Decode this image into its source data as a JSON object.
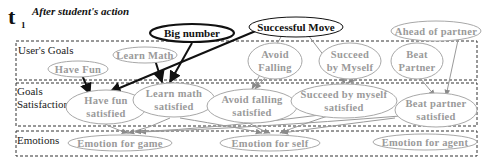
{
  "header": {
    "time_symbol": "t",
    "time_subscript": "1",
    "caption": "After student's action"
  },
  "sections": [
    {
      "id": "users-goals",
      "label_lines": [
        "User's Goals"
      ]
    },
    {
      "id": "goals-satisfaction",
      "label_lines": [
        "Goals",
        "Satisfaction"
      ]
    },
    {
      "id": "emotions",
      "label_lines": [
        "Emotions"
      ]
    }
  ],
  "events": [
    {
      "id": "big-number",
      "label": "Big number",
      "style": "bold"
    },
    {
      "id": "successful-move",
      "label": "Successful Move",
      "style": "bold"
    },
    {
      "id": "ahead-of-partner",
      "label": "Ahead of partner",
      "style": "faded"
    }
  ],
  "user_goals": [
    {
      "id": "have-fun",
      "lines": [
        "Have Fun"
      ]
    },
    {
      "id": "learn-math",
      "lines": [
        "Learn Math"
      ]
    },
    {
      "id": "avoid-falling",
      "lines": [
        "Avoid",
        "Falling"
      ]
    },
    {
      "id": "succeed-by-myself",
      "lines": [
        "Succeed",
        "by Myself"
      ]
    },
    {
      "id": "beat-partner",
      "lines": [
        "Beat",
        "Partner"
      ]
    }
  ],
  "goals_satisfaction": [
    {
      "id": "have-fun-satisfied",
      "lines": [
        "Have fun",
        "satisfied"
      ]
    },
    {
      "id": "learn-math-satisfied",
      "lines": [
        "Learn math",
        "satisfied"
      ]
    },
    {
      "id": "avoid-falling-satisfied",
      "lines": [
        "Avoid falling",
        "satisfied"
      ]
    },
    {
      "id": "succeed-by-myself-satisfied",
      "lines": [
        "Succeed by myself",
        "satisfied"
      ]
    },
    {
      "id": "beat-partner-satisfied",
      "lines": [
        "Beat partner",
        "satisfied"
      ]
    }
  ],
  "emotions": [
    {
      "id": "emotion-for-game",
      "label": "Emotion for game"
    },
    {
      "id": "emotion-for-self",
      "label": "Emotion for  self"
    },
    {
      "id": "emotion-for-agent",
      "label": "Emotion for agent"
    }
  ],
  "edges": [
    {
      "from": "big-number",
      "to": "learn-math-satisfied",
      "style": "dark"
    },
    {
      "from": "big-number",
      "to": "have-fun-satisfied",
      "style": "dark"
    },
    {
      "from": "successful-move",
      "to": "have-fun-satisfied",
      "style": "dark"
    },
    {
      "from": "successful-move",
      "to": "learn-math-satisfied",
      "style": "dark"
    },
    {
      "from": "learn-math",
      "to": "learn-math-satisfied",
      "style": "dark"
    },
    {
      "from": "have-fun",
      "to": "have-fun-satisfied",
      "style": "dark"
    },
    {
      "from": "successful-move",
      "to": "avoid-falling-satisfied",
      "style": "gray"
    },
    {
      "from": "successful-move",
      "to": "succeed-by-myself-satisfied",
      "style": "gray"
    },
    {
      "from": "avoid-falling",
      "to": "avoid-falling-satisfied",
      "style": "gray"
    },
    {
      "from": "succeed-by-myself",
      "to": "succeed-by-myself-satisfied",
      "style": "gray"
    },
    {
      "from": "ahead-of-partner",
      "to": "beat-partner-satisfied",
      "style": "gray"
    },
    {
      "from": "beat-partner",
      "to": "beat-partner-satisfied",
      "style": "gray"
    },
    {
      "from": "have-fun-satisfied",
      "to": "emotion-for-game",
      "style": "gray"
    },
    {
      "from": "learn-math-satisfied",
      "to": "emotion-for-game",
      "style": "gray"
    },
    {
      "from": "avoid-falling-satisfied",
      "to": "emotion-for-self",
      "style": "gray"
    },
    {
      "from": "succeed-by-myself-satisfied",
      "to": "emotion-for-self",
      "style": "gray"
    },
    {
      "from": "beat-partner-satisfied",
      "to": "emotion-for-game",
      "style": "gray"
    },
    {
      "from": "beat-partner-satisfied",
      "to": "emotion-for-self",
      "style": "gray"
    }
  ]
}
